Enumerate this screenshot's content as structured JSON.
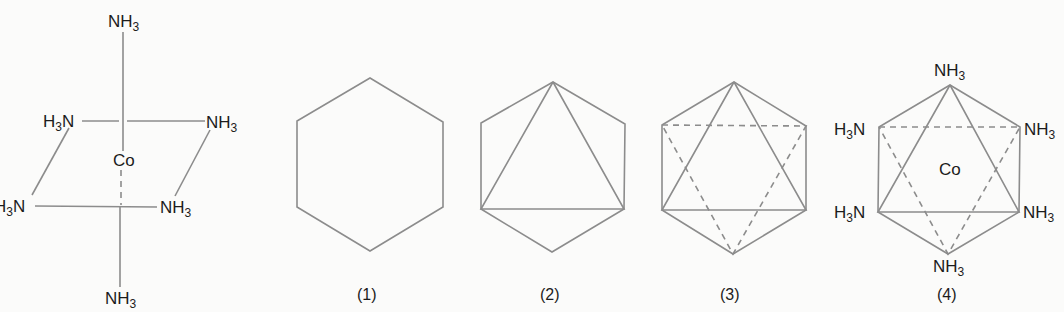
{
  "figure": {
    "type": "octahedral-complex-diagram",
    "central_atom": "Co",
    "ligand": {
      "base": "NH",
      "subscript": "3"
    },
    "ligand_reversed": {
      "prefix": "H",
      "subscript": "3",
      "suffix": "N"
    },
    "colors": {
      "lines": "#8c8c8c",
      "text": "#1c1c1c",
      "background": "#fbfbfa"
    }
  },
  "panels": [
    {
      "id": "perspective",
      "caption": "",
      "labels": {
        "top": "NH3",
        "upper_left": "H3N",
        "upper_right": "NH3",
        "center": "Co",
        "lower_left": "H3N",
        "lower_right": "NH3",
        "bottom": "NH3"
      }
    },
    {
      "id": "step-1",
      "caption": "(1)",
      "description": "hexagon outline"
    },
    {
      "id": "step-2",
      "caption": "(2)",
      "description": "hexagon with solid front triangle"
    },
    {
      "id": "step-3",
      "caption": "(3)",
      "description": "hexagon with solid front triangle and dashed back triangle"
    },
    {
      "id": "step-4",
      "caption": "(4)",
      "description": "completed octahedron with ligands",
      "labels": {
        "top": "NH3",
        "upper_left": "H3N",
        "upper_right": "NH3",
        "center": "Co",
        "lower_left": "H3N",
        "lower_right": "NH3",
        "bottom": "NH3"
      }
    }
  ],
  "text": {
    "co": "Co",
    "nh": "NH",
    "h": "H",
    "n": "N",
    "three": "3",
    "cap1": "(1)",
    "cap2": "(2)",
    "cap3": "(3)",
    "cap4": "(4)"
  }
}
